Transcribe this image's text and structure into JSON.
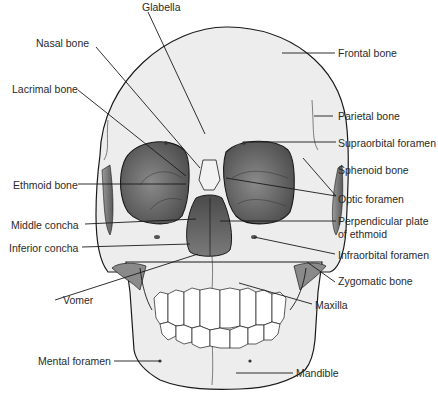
{
  "diagram": {
    "labels_left": [
      {
        "id": "nasal-bone",
        "text": "Nasal bone"
      },
      {
        "id": "lacrimal-bone",
        "text": "Lacrimal bone"
      },
      {
        "id": "ethmoid-bone",
        "text": "Ethmoid bone"
      },
      {
        "id": "middle-concha",
        "text": "Middle concha"
      },
      {
        "id": "inferior-concha",
        "text": "Inferior concha"
      },
      {
        "id": "vomer",
        "text": "Vomer"
      },
      {
        "id": "mental-foramen",
        "text": "Mental foramen"
      }
    ],
    "labels_top": [
      {
        "id": "glabella",
        "text": "Glabella"
      }
    ],
    "labels_right": [
      {
        "id": "frontal-bone",
        "text": "Frontal bone"
      },
      {
        "id": "parietal-bone",
        "text": "Parietal bone"
      },
      {
        "id": "supraorbital-foramen",
        "text": "Supraorbital foramen"
      },
      {
        "id": "sphenoid-bone",
        "text": "Sphenoid bone"
      },
      {
        "id": "optic-foramen",
        "text": "Optic foramen"
      },
      {
        "id": "perpendicular-plate",
        "text": "Perpendicular plate",
        "line2": "of ethmoid"
      },
      {
        "id": "infraorbital-foramen",
        "text": "Infraorbital foramen"
      },
      {
        "id": "zygomatic-bone",
        "text": "Zygomatic bone"
      },
      {
        "id": "maxilla",
        "text": "Maxilla"
      },
      {
        "id": "mandible",
        "text": "Mandible"
      }
    ],
    "colors": {
      "bone_fill": "#ededed",
      "outline": "#1a1a1a",
      "orbit_dark": "#555555",
      "orbit_light": "#9a9a9a",
      "leader_line": "#1a1a1a",
      "text": "#2a2a2a"
    }
  }
}
